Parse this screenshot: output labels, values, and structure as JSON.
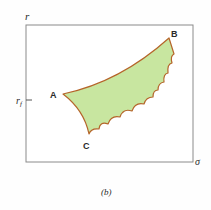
{
  "figure": {
    "caption": "(b)",
    "axes": {
      "y_label": "r",
      "y_tick_label": "r",
      "y_tick_subscript": "f",
      "x_label": "σ"
    },
    "points": {
      "A": "A",
      "B": "B",
      "C": "C"
    },
    "colors": {
      "frame": "#8a8a8a",
      "region_fill": "#c8e6a0",
      "region_stroke": "#b5652a",
      "text": "#2a2a2a"
    }
  }
}
